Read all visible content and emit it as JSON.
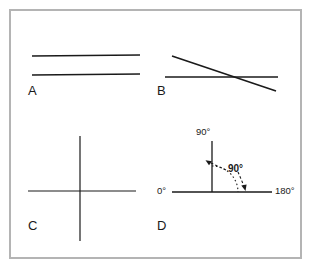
{
  "figure": {
    "width": 315,
    "height": 270,
    "background_color": "#ffffff",
    "border_color": "#b4b4b4",
    "line_color": "#1a1a1a",
    "panels": [
      {
        "id": "A",
        "label": "A",
        "description": "two parallel horizontal lines",
        "label_x": 28,
        "label_y": 84
      },
      {
        "id": "B",
        "label": "B",
        "description": "horizontal line crossed by descending diagonal line",
        "label_x": 157,
        "label_y": 84
      },
      {
        "id": "C",
        "label": "C",
        "description": "perpendicular cross of horizontal and vertical lines",
        "label_x": 28,
        "label_y": 219
      },
      {
        "id": "D",
        "label": "D",
        "description": "right angle between vertical 90 degree axis and horizontal axis from 0 to 180 degrees",
        "label_x": 157,
        "label_y": 219
      }
    ]
  },
  "panel_a": {
    "lines": [
      {
        "x1": 32,
        "y1": 56,
        "x2": 140,
        "y2": 55
      },
      {
        "x1": 32,
        "y1": 75,
        "x2": 140,
        "y2": 74
      }
    ]
  },
  "panel_b": {
    "lines": [
      {
        "x1": 165,
        "y1": 77,
        "x2": 278,
        "y2": 77
      },
      {
        "x1": 172,
        "y1": 56,
        "x2": 276,
        "y2": 91
      }
    ]
  },
  "panel_c": {
    "lines": [
      {
        "x1": 28,
        "y1": 191,
        "x2": 136,
        "y2": 191
      },
      {
        "x1": 80,
        "y1": 136,
        "x2": 80,
        "y2": 241
      }
    ]
  },
  "panel_d": {
    "axes": [
      {
        "name": "horizontal-axis",
        "x1": 172,
        "y1": 192,
        "x2": 272,
        "y2": 192
      },
      {
        "name": "vertical-axis",
        "x1": 212,
        "y1": 141,
        "x2": 212,
        "y2": 192
      }
    ],
    "labels": {
      "top": "90°",
      "left": "0°",
      "right": "180°",
      "angle": "90°"
    },
    "label_positions": {
      "top_x": 196,
      "top_y": 127,
      "left_x": 157,
      "left_y": 186,
      "right_x": 275,
      "right_y": 186,
      "angle_x": 228,
      "angle_y": 164
    },
    "arc": {
      "center_x": 212,
      "center_y": 192,
      "radius": 26,
      "style": "dotted"
    },
    "arrows": [
      {
        "name": "arrow-to-vertical-axis",
        "from_x": 226,
        "from_y": 170,
        "to_x": 206,
        "to_y": 161,
        "style": "dashed"
      },
      {
        "name": "arrow-to-horizontal-axis",
        "from_x": 238,
        "from_y": 172,
        "to_x": 245,
        "to_y": 190,
        "style": "dashed"
      }
    ]
  }
}
